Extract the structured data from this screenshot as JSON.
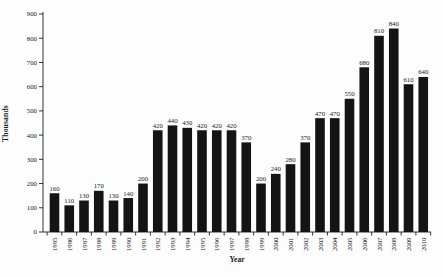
{
  "chart_data": {
    "type": "bar",
    "title": "",
    "xlabel": "Year",
    "ylabel": "Thousands",
    "categories": [
      "1985",
      "1986",
      "1987",
      "1988",
      "1989",
      "1990",
      "1991",
      "1992",
      "1993",
      "1994",
      "1995",
      "1996",
      "1997",
      "1998",
      "1999",
      "2000",
      "2001",
      "2002",
      "2003",
      "2004",
      "2005",
      "2006",
      "2007",
      "2008",
      "2009",
      "2010"
    ],
    "values": [
      160,
      110,
      130,
      170,
      130,
      140,
      200,
      420,
      440,
      430,
      420,
      420,
      420,
      370,
      200,
      240,
      280,
      370,
      470,
      470,
      550,
      680,
      810,
      840,
      610,
      640
    ],
    "value_labels_shown": true,
    "ylim": [
      0,
      900
    ],
    "ytick_interval": 100,
    "ytick_labels": [
      "0",
      "100",
      "200",
      "300",
      "400",
      "500",
      "600",
      "700",
      "800",
      "900"
    ],
    "grid": false,
    "legend": false,
    "bar_color": "#141414",
    "axis_color": "#333333",
    "text_color": "#1a1a1a",
    "background_color": "#fdfdfd"
  }
}
